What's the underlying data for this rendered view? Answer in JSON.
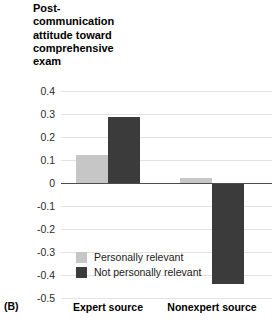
{
  "panel_label": "(B)",
  "chart_data": {
    "type": "bar",
    "title": "Post-\ncommunication\nattitude toward\ncomprehensive\nexam",
    "xlabel": "",
    "ylabel": "",
    "categories": [
      "Expert source",
      "Nonexpert source"
    ],
    "series": [
      {
        "name": "Personally relevant",
        "color": "#c6c6c6",
        "values": [
          0.12,
          0.02
        ]
      },
      {
        "name": "Not personally relevant",
        "color": "#3b3b3b",
        "values": [
          0.285,
          -0.44
        ]
      }
    ],
    "ylim": [
      -0.5,
      0.4
    ],
    "ytick_values": [
      0.4,
      0.3,
      0.2,
      0.1,
      0,
      -0.1,
      -0.2,
      -0.3,
      -0.4,
      -0.5
    ],
    "ytick_labels": [
      "0.4",
      "0.3",
      "0.2",
      "0.1",
      "0",
      "-0.1",
      "-0.2",
      "-0.3",
      "-0.4",
      "-0.5"
    ],
    "grid": true,
    "legend_position": "lower-left-inside",
    "zero_line_color": "#4d4d4d",
    "gridline_color": "#e3e3e3"
  }
}
